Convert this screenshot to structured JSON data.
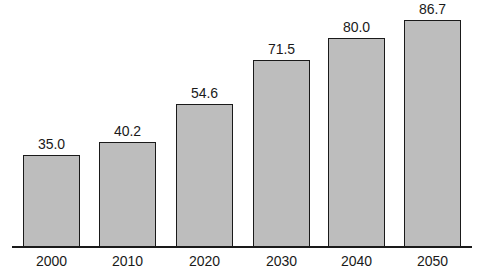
{
  "chart_data": {
    "type": "bar",
    "title": "",
    "xlabel": "",
    "ylabel": "",
    "categories": [
      "2000",
      "2010",
      "2020",
      "2030",
      "2040",
      "2050"
    ],
    "values": [
      35.0,
      40.2,
      54.6,
      71.5,
      80.0,
      86.7
    ],
    "value_labels": [
      "35.0",
      "40.2",
      "54.6",
      "71.5",
      "80.0",
      "86.7"
    ],
    "ylim": [
      0,
      90
    ],
    "grid": false,
    "legend": null,
    "colors": {
      "bar_fill": "#bdbdbd",
      "bar_edge": "#1a1a1a",
      "axis": "#1a1a1a"
    }
  }
}
